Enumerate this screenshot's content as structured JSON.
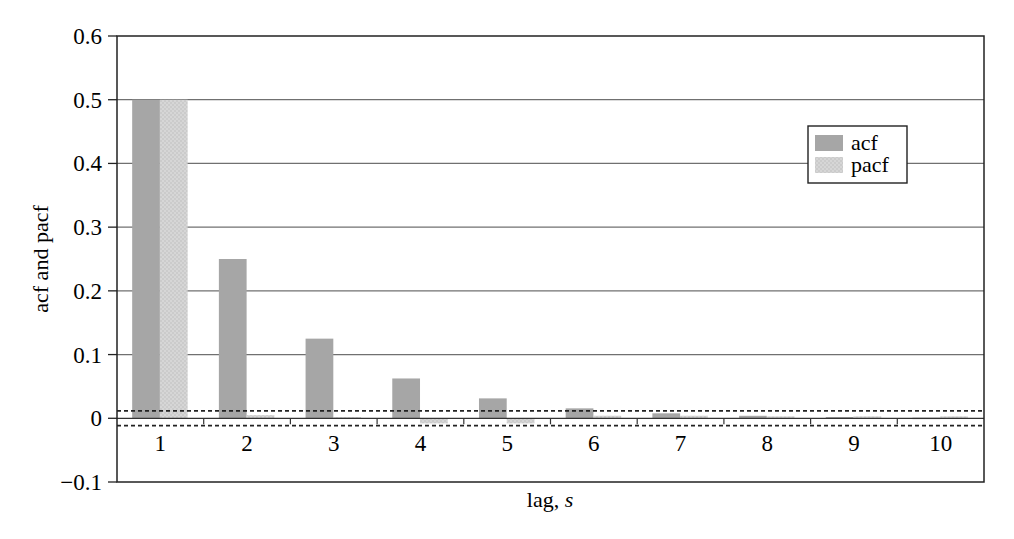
{
  "chart_data": {
    "type": "bar",
    "title": "",
    "xlabel": "lag, s",
    "xlabel_parts": {
      "text": "lag, ",
      "italic": "s"
    },
    "ylabel": "acf and pacf",
    "ylim": [
      -0.1,
      0.6
    ],
    "yticks": [
      -0.1,
      0,
      0.1,
      0.2,
      0.3,
      0.4,
      0.5,
      0.6
    ],
    "ytick_labels": [
      "−0.1",
      "0",
      "0.1",
      "0.2",
      "0.3",
      "0.4",
      "0.5",
      "0.6"
    ],
    "categories": [
      "1",
      "2",
      "3",
      "4",
      "5",
      "6",
      "7",
      "8",
      "9",
      "10"
    ],
    "series": [
      {
        "name": "acf",
        "color": "#a6a6a6",
        "values": [
          0.5,
          0.25,
          0.125,
          0.0625,
          0.03125,
          0.0156,
          0.0078,
          0.0039,
          0.002,
          0.001
        ]
      },
      {
        "name": "pacf",
        "color": "#d4d4d4",
        "values": [
          0.5,
          0.005,
          0.002,
          -0.008,
          -0.008,
          0.004,
          0.004,
          0.003,
          0.003,
          0.003
        ]
      }
    ],
    "confidence_band": [
      -0.01,
      0.01
    ],
    "grid": {
      "horizontal": true,
      "vertical": false
    },
    "legend_position": "upper right"
  },
  "legend": {
    "items": [
      {
        "label": "acf"
      },
      {
        "label": "pacf"
      }
    ]
  }
}
